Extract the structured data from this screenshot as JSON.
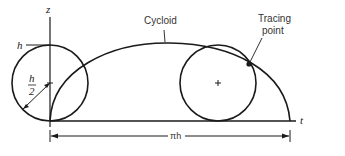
{
  "labels": {
    "z_axis": "z",
    "t_axis": "t",
    "height": "h",
    "radius_num": "h",
    "radius_den": "2",
    "cycloid": "Cycloid",
    "tracing_point_line1": "Tracing",
    "tracing_point_line2": "point",
    "span": "πh"
  },
  "colors": {
    "stroke": "#1a1a1a",
    "background": "#ffffff"
  }
}
